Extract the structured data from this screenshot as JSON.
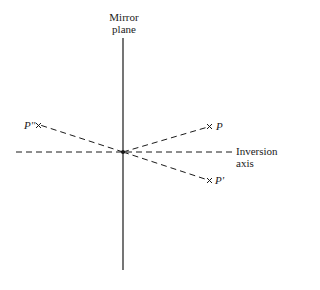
{
  "diagram": {
    "labels": {
      "mirror_plane": [
        "Mirror",
        "plane"
      ],
      "inversion_axis": [
        "Inversion",
        "axis"
      ]
    },
    "points": {
      "p": "P",
      "p_prime": "P'",
      "p_double_prime": "P''"
    },
    "marker_glyph": "×",
    "colors": {
      "ink": "#1a1a1a",
      "background": "#ffffff"
    }
  }
}
